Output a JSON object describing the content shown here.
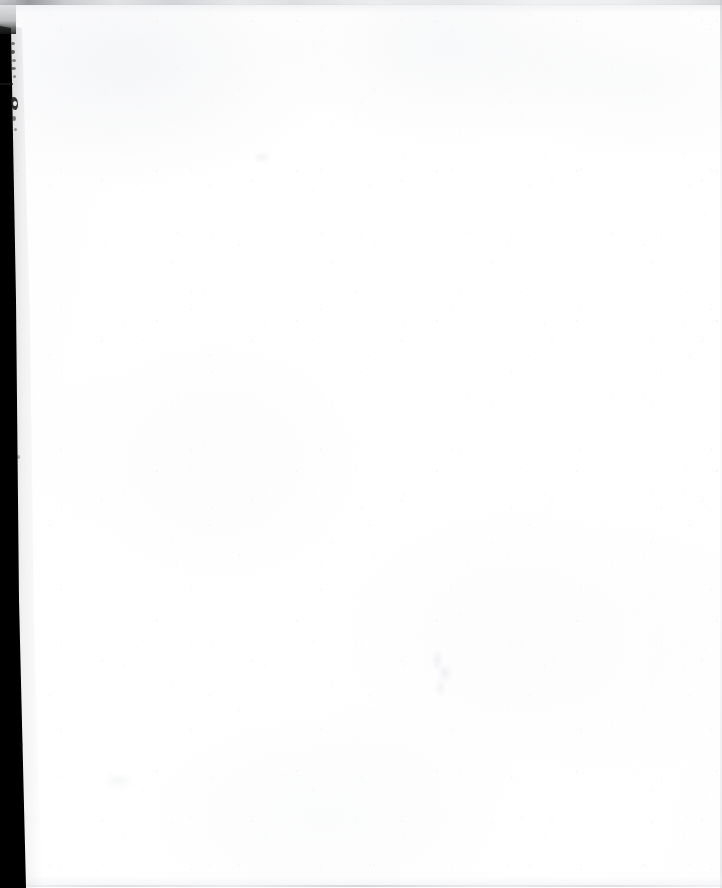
{
  "document": {
    "kind": "scanned-page",
    "content_state": "blank",
    "visible_text": "",
    "page_width_px": 722,
    "page_height_px": 888
  },
  "colors": {
    "paper": "#fefefe",
    "paper_warm_tint": "#fdfdfe",
    "gutter_black": "#000000",
    "gutter_penumbra": "#222222",
    "top_edge_grey": "#8a8c90",
    "top_edge_grey_light": "#d8dadd",
    "bottom_edge_grey": "#c8cace",
    "right_edge_grey": "#c4c6ca",
    "artifact_ink": "#1a1a1a",
    "smudge_grey": "#eeeff1"
  },
  "regions": {
    "paper_field": {
      "label": "Blank paper field",
      "x": 0,
      "y": 0,
      "width": 722,
      "height": 888
    },
    "left_gutter": {
      "label": "Left scanner gutter shadow",
      "x": 0,
      "y": 26,
      "width": 26,
      "height": 862,
      "top_width_px": 11,
      "bottom_width_px": 26
    },
    "top_edge": {
      "label": "Top scan edge band",
      "x": 0,
      "y": 0,
      "width": 722,
      "height": 5
    },
    "bottom_edge": {
      "label": "Bottom scan edge hairline",
      "x": 24,
      "y": 885,
      "width": 698,
      "height": 2
    },
    "right_edge": {
      "label": "Right scan edge hairline",
      "x": 720,
      "y": 0,
      "width": 2,
      "height": 888
    }
  },
  "artifacts": [
    {
      "name": "left-margin-speck",
      "x": 11,
      "y": 42
    },
    {
      "name": "left-margin-speck",
      "x": 10,
      "y": 50
    },
    {
      "name": "left-margin-speck",
      "x": 12,
      "y": 59
    },
    {
      "name": "left-margin-speck",
      "x": 11,
      "y": 67
    },
    {
      "name": "left-margin-speck",
      "x": 13,
      "y": 75
    },
    {
      "name": "left-margin-tick",
      "x": 0,
      "y": 83
    },
    {
      "name": "left-margin-ink-blot",
      "x": 11,
      "y": 97
    },
    {
      "name": "left-margin-speck",
      "x": 12,
      "y": 116
    },
    {
      "name": "left-margin-speck",
      "x": 14,
      "y": 128
    },
    {
      "name": "left-margin-speck",
      "x": 17,
      "y": 455
    },
    {
      "name": "left-margin-speck",
      "x": 19,
      "y": 742
    },
    {
      "name": "centre-smudge",
      "x": 424,
      "y": 646
    },
    {
      "name": "upper-smudge",
      "x": 248,
      "y": 148
    },
    {
      "name": "lower-left-smudge",
      "x": 96,
      "y": 768
    }
  ],
  "caption": "Blank scanned page with dark left gutter shadow"
}
